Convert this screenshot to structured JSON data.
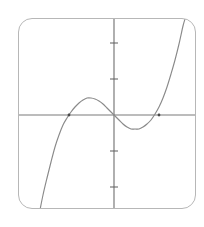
{
  "widget": {
    "name": "cubic-function-graph-card",
    "background_color": "#ffffff",
    "card_border_color": "#b7b7b7",
    "card_corner_radius": "14px"
  },
  "chart_data": {
    "type": "line",
    "title": "",
    "subtitle": "",
    "xlabel": "",
    "ylabel": "",
    "grid": false,
    "legend": null,
    "axis_color": "#7b7b7b",
    "curve_color": "#8a8a8a",
    "function": "cubic",
    "xlim": [
      -5.3,
      4.6
    ],
    "ylim": [
      -5.3,
      5.3
    ],
    "origin_px": {
      "x": 95,
      "y": 96
    },
    "unit_px": {
      "x": 18,
      "y": 18
    },
    "x_axis": {
      "y_px": 96,
      "x_start_px": 0,
      "x_end_px": 178,
      "ticks": []
    },
    "y_axis": {
      "x_px": 95,
      "y_start_px": 0,
      "y_end_px": 191,
      "ticks_px": [
        24,
        60,
        132,
        168
      ],
      "tick_half_length_px": 4
    },
    "x_intercepts_px": [
      {
        "x": 50,
        "y": 96
      },
      {
        "x": 95,
        "y": 96
      },
      {
        "x": 140,
        "y": 96
      }
    ],
    "local_max_px": {
      "x": 70,
      "y": 79
    },
    "local_min_px": {
      "x": 119,
      "y": 110
    },
    "curve_points_px": [
      {
        "x": 21,
        "y": 191
      },
      {
        "x": 24,
        "y": 176
      },
      {
        "x": 28,
        "y": 159
      },
      {
        "x": 32,
        "y": 143
      },
      {
        "x": 36,
        "y": 128
      },
      {
        "x": 40,
        "y": 116
      },
      {
        "x": 44,
        "y": 106
      },
      {
        "x": 48,
        "y": 99
      },
      {
        "x": 52,
        "y": 93
      },
      {
        "x": 56,
        "y": 88
      },
      {
        "x": 60,
        "y": 84
      },
      {
        "x": 64,
        "y": 81
      },
      {
        "x": 68,
        "y": 79
      },
      {
        "x": 72,
        "y": 79
      },
      {
        "x": 76,
        "y": 80
      },
      {
        "x": 80,
        "y": 82
      },
      {
        "x": 84,
        "y": 85
      },
      {
        "x": 88,
        "y": 89
      },
      {
        "x": 92,
        "y": 93
      },
      {
        "x": 96,
        "y": 97
      },
      {
        "x": 100,
        "y": 101
      },
      {
        "x": 104,
        "y": 105
      },
      {
        "x": 108,
        "y": 108
      },
      {
        "x": 112,
        "y": 110
      },
      {
        "x": 116,
        "y": 110
      },
      {
        "x": 120,
        "y": 110
      },
      {
        "x": 124,
        "y": 108
      },
      {
        "x": 128,
        "y": 105
      },
      {
        "x": 132,
        "y": 101
      },
      {
        "x": 136,
        "y": 95
      },
      {
        "x": 140,
        "y": 88
      },
      {
        "x": 144,
        "y": 79
      },
      {
        "x": 148,
        "y": 68
      },
      {
        "x": 152,
        "y": 55
      },
      {
        "x": 156,
        "y": 41
      },
      {
        "x": 160,
        "y": 25
      },
      {
        "x": 164,
        "y": 7
      },
      {
        "x": 166,
        "y": 0
      }
    ]
  }
}
